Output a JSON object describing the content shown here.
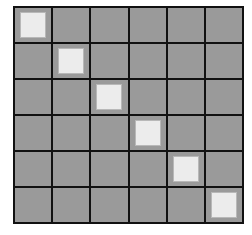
{
  "grid": {
    "rows": 6,
    "cols": 6,
    "cell_color": "#9a9a9a",
    "line_color": "#111111",
    "marker_color": "#ececec",
    "markers": [
      [
        0,
        0
      ],
      [
        1,
        1
      ],
      [
        2,
        2
      ],
      [
        3,
        3
      ],
      [
        4,
        4
      ],
      [
        5,
        5
      ]
    ]
  }
}
